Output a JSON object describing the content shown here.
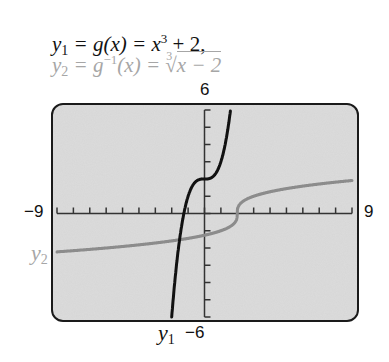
{
  "equations": {
    "y1": {
      "lhs": "y",
      "sub": "1",
      "mid": " = g(x) = x",
      "sup": "3",
      "rhs": " + 2,",
      "color": "#111111"
    },
    "y2": {
      "lhs": "y",
      "sub": "2",
      "mid": " = g",
      "sup": "−1",
      "mid2": "(x) = ",
      "root_index": "3",
      "radicand": "x − 2",
      "color": "#a6a6a6"
    }
  },
  "window": {
    "ymax_label": "6",
    "ymin_label": "−6",
    "xmin_label": "−9",
    "xmax_label": "9"
  },
  "labels": {
    "y1": {
      "text": "y",
      "sub": "1"
    },
    "y2": {
      "text": "y",
      "sub": "2"
    }
  },
  "chart_data": {
    "type": "line",
    "title": "",
    "xlabel": "",
    "ylabel": "",
    "xlim": [
      -9,
      9
    ],
    "ylim": [
      -6,
      6
    ],
    "xscale_ticks": 1,
    "yscale_ticks": 1,
    "grid": false,
    "legend_position": "curve labels",
    "series": [
      {
        "name": "y1 = g(x) = x^3 + 2",
        "color": "#111111",
        "x": [
          -2.0,
          -1.8,
          -1.6,
          -1.4,
          -1.2,
          -1.0,
          -0.8,
          -0.6,
          -0.4,
          -0.2,
          0.0,
          0.2,
          0.4,
          0.6,
          0.8,
          1.0,
          1.2,
          1.4,
          1.587
        ],
        "y": [
          -6.0,
          -3.83,
          -2.1,
          -0.74,
          0.27,
          1.0,
          1.49,
          1.78,
          1.94,
          1.99,
          2.0,
          2.01,
          2.06,
          2.22,
          2.51,
          3.0,
          3.73,
          4.74,
          6.0
        ]
      },
      {
        "name": "y2 = g^-1(x) = cbrt(x - 2)",
        "color": "#8c8c8c",
        "x": [
          -9,
          -7,
          -5,
          -3,
          -1,
          0,
          1,
          1.5,
          1.9,
          2.0,
          2.1,
          2.5,
          3,
          5,
          7,
          9
        ],
        "y": [
          -2.22,
          -2.08,
          -1.91,
          -1.71,
          -1.44,
          -1.26,
          -1.0,
          -0.79,
          -0.46,
          0.0,
          0.46,
          0.79,
          1.0,
          1.44,
          1.71,
          1.91
        ]
      }
    ]
  },
  "colors": {
    "screen_bg": "#dcdcdc",
    "frame": "#1a1a1a",
    "axis": "#333333",
    "y1_curve": "#111111",
    "y2_curve": "#8c8c8c"
  }
}
